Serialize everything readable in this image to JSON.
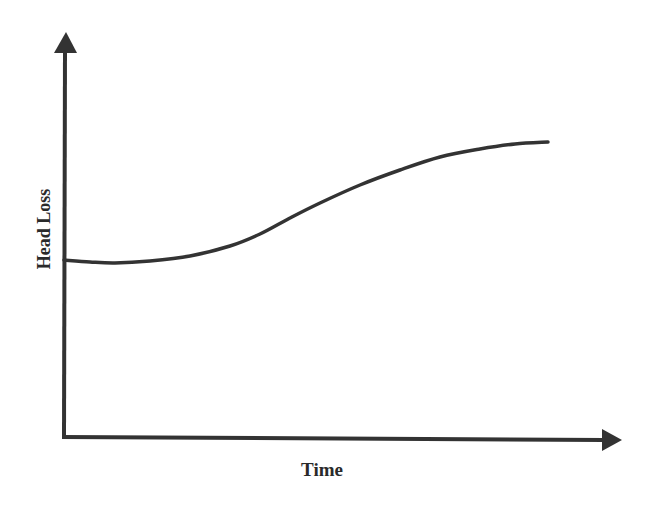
{
  "chart_data": {
    "type": "line",
    "title": "",
    "xlabel": "Time",
    "ylabel": "Head Loss",
    "grid": false,
    "legend": null,
    "axis_ticks": "none",
    "series": [
      {
        "name": "Head Loss curve",
        "description": "Starts at a non-zero baseline, stays nearly flat (slight dip), then rises in an S-shape and levels off at a plateau",
        "points_px": [
          [
            64,
            260
          ],
          [
            90,
            262
          ],
          [
            115,
            263
          ],
          [
            150,
            261
          ],
          [
            190,
            256
          ],
          [
            230,
            246
          ],
          [
            260,
            234
          ],
          [
            290,
            218
          ],
          [
            320,
            203
          ],
          [
            360,
            185
          ],
          [
            400,
            170
          ],
          [
            440,
            157
          ],
          [
            480,
            149
          ],
          [
            515,
            144
          ],
          [
            548,
            142
          ]
        ]
      }
    ],
    "colors": {
      "line": "#333333",
      "axes": "#333333",
      "background": "#ffffff"
    }
  },
  "labels": {
    "x_axis": "Time",
    "y_axis": "Head Loss"
  }
}
